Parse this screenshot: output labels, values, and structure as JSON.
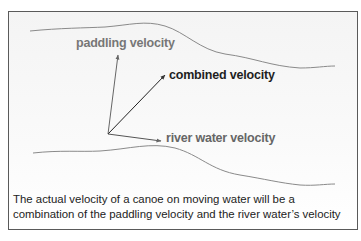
{
  "diagram": {
    "labels": {
      "paddling": "paddling velocity",
      "combined": "combined velocity",
      "river": "river water velocity"
    },
    "vectors": [
      {
        "name": "paddling velocity",
        "from": [
          108,
          134
        ],
        "to": [
          118,
          54
        ],
        "color": "#777777"
      },
      {
        "name": "combined velocity",
        "from": [
          108,
          134
        ],
        "to": [
          165,
          75
        ],
        "color": "#1e1e1e"
      },
      {
        "name": "river water velocity",
        "from": [
          108,
          134
        ],
        "to": [
          161,
          141
        ],
        "color": "#555555"
      }
    ],
    "caption": "The actual velocity of a canoe on moving water will be a combination of the paddling velocity and the river water’s velocity",
    "colors": {
      "border": "#5a5a5a",
      "riverbank": "#8a8a8a",
      "background": "#f6f6f6"
    }
  }
}
